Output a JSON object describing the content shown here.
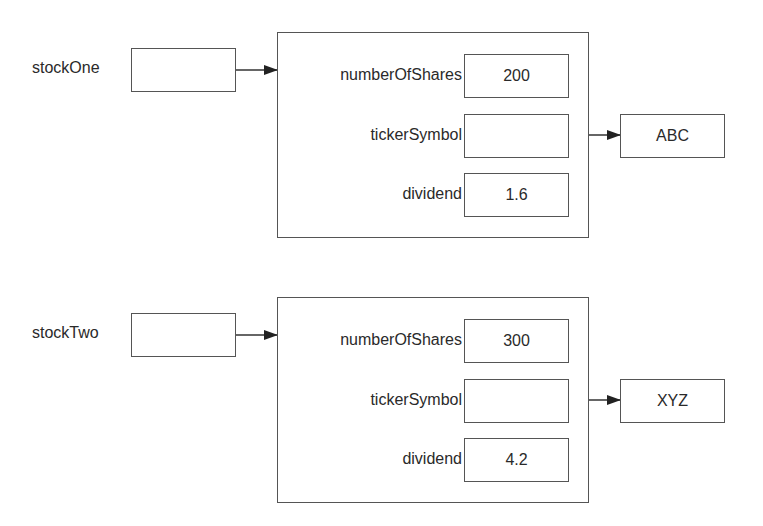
{
  "stocks": [
    {
      "variable": "stockOne",
      "fields": [
        {
          "name": "numberOfShares",
          "value": "200"
        },
        {
          "name": "tickerSymbol",
          "value": ""
        },
        {
          "name": "dividend",
          "value": "1.6"
        }
      ],
      "ticker_string": "ABC"
    },
    {
      "variable": "stockTwo",
      "fields": [
        {
          "name": "numberOfShares",
          "value": "300"
        },
        {
          "name": "tickerSymbol",
          "value": ""
        },
        {
          "name": "dividend",
          "value": "4.2"
        }
      ],
      "ticker_string": "XYZ"
    }
  ],
  "colors": {
    "line": "#555555",
    "text": "#2a2a2a",
    "background": "#ffffff"
  }
}
